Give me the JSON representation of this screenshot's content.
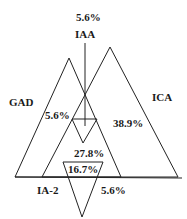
{
  "diagram": {
    "type": "venn-triangles",
    "sets": [
      {
        "id": "GAD",
        "label": "GAD"
      },
      {
        "id": "ICA",
        "label": "ICA"
      },
      {
        "id": "IAA",
        "label": "IAA"
      },
      {
        "id": "IA2",
        "label": "IA-2"
      }
    ],
    "regions": [
      {
        "id": "iaa_only",
        "value": "5.6%"
      },
      {
        "id": "gad_region",
        "value": "5.6%"
      },
      {
        "id": "ica_region",
        "value": "38.9%"
      },
      {
        "id": "center_region",
        "value": "27.8%"
      },
      {
        "id": "inner_region",
        "value": "16.7%"
      },
      {
        "id": "ia2_region",
        "value": "5.6%"
      }
    ],
    "colors": {
      "stroke": "#222222",
      "text": "#1a1a1a",
      "background": "#ffffff"
    }
  }
}
